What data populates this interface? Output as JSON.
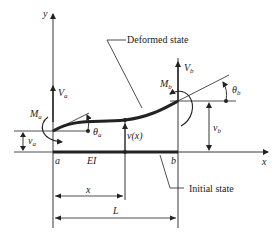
{
  "diagram": {
    "labels": {
      "y_axis": "y",
      "x_axis": "x",
      "deformed_state": "Deformed state",
      "initial_state": "Initial state",
      "node_a": "a",
      "node_b": "b",
      "stiffness": "EI",
      "deflection_fn": "v(x)",
      "position": "x",
      "length": "L"
    },
    "forces": {
      "Va": {
        "main": "V",
        "sub": "a"
      },
      "Vb": {
        "main": "V",
        "sub": "b"
      },
      "Ma": {
        "main": "M",
        "sub": "a"
      },
      "Mb": {
        "main": "M",
        "sub": "b"
      },
      "theta_a": {
        "main": "θ",
        "sub": "a"
      },
      "theta_b": {
        "main": "θ",
        "sub": "b"
      },
      "va": {
        "main": "v",
        "sub": "a"
      },
      "vb": {
        "main": "v",
        "sub": "b"
      }
    },
    "colors": {
      "ink": "#222222",
      "background": "#ffffff"
    }
  }
}
